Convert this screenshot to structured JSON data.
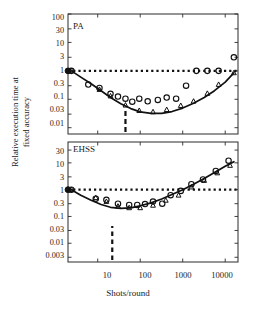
{
  "figure": {
    "xlabel": "Shots/round",
    "ylabel_line1": "Relative execution time at",
    "ylabel_line2": "fixed accuracy"
  },
  "chart_data": {
    "type": "line",
    "title": "",
    "xlabel": "Shots/round",
    "ylabel": "Relative execution time at fixed accuracy",
    "xscale": "log",
    "yscale": "log",
    "xlim": [
      2.0,
      20000
    ],
    "xticks": [
      10,
      100,
      1000,
      10000
    ],
    "xticklabels": [
      "10",
      "100",
      "1000",
      "10000"
    ],
    "panels": [
      {
        "name": "PA",
        "label": "PA",
        "ylim": [
          0.006,
          100
        ],
        "yticks": [
          100,
          30,
          10,
          3,
          1,
          0.3,
          0.1,
          0.03,
          0.01
        ],
        "yticklabels": [
          "100",
          "30",
          "10",
          "3",
          "1",
          "0.3",
          "0.1",
          "0.03",
          "0.01"
        ],
        "reference_line": {
          "style": "dotted",
          "y": 1.0
        },
        "optimum_marker": {
          "style": "dashed-vertical",
          "x": 45
        },
        "series": [
          {
            "name": "model curve",
            "style": "solid-line",
            "x": [
              2.4,
              4,
              7,
              12,
              20,
              35,
              60,
              100,
              180,
              320,
              560,
              1000,
              1800,
              3200,
              5600,
              10000,
              16000
            ],
            "values": [
              1.0,
              0.6,
              0.35,
              0.2,
              0.115,
              0.07,
              0.047,
              0.036,
              0.032,
              0.032,
              0.037,
              0.049,
              0.073,
              0.115,
              0.2,
              0.4,
              0.85
            ]
          },
          {
            "name": "open circles",
            "style": "open-circle",
            "x": [
              2.4,
              6,
              11,
              20,
              30,
              45,
              65,
              95,
              150,
              260,
              420,
              700,
              1200,
              2100,
              3800,
              7000,
              16000
            ],
            "values": [
              1.0,
              0.33,
              0.25,
              0.155,
              0.125,
              0.105,
              0.082,
              0.105,
              0.085,
              0.095,
              0.115,
              0.105,
              0.3,
              1.0,
              1.0,
              1.0,
              3.0
            ]
          },
          {
            "name": "triangles",
            "style": "triangle",
            "x": [
              2.4,
              11,
              20,
              45,
              95,
              200,
              420,
              900,
              1800,
              3800,
              7000,
              16000
            ],
            "values": [
              1.0,
              0.22,
              0.13,
              0.062,
              0.04,
              0.036,
              0.043,
              0.06,
              0.085,
              0.16,
              0.33,
              0.85
            ]
          }
        ]
      },
      {
        "name": "EHSS",
        "label": "EHSS",
        "ylim": [
          0.002,
          60
        ],
        "yticks": [
          30,
          10,
          3,
          1,
          0.3,
          0.1,
          0.03,
          0.01,
          0.003
        ],
        "yticklabels": [
          "30",
          "10",
          "3",
          "1",
          "0.3",
          "0.1",
          "0.03",
          "0.01",
          "0.003"
        ],
        "reference_line": {
          "style": "dotted",
          "y": 1.0
        },
        "optimum_marker": {
          "style": "dashed-vertical",
          "x": 22
        },
        "series": [
          {
            "name": "model curve",
            "style": "solid-line",
            "x": [
              2.4,
              4,
              7,
              12,
              20,
              35,
              60,
              100,
              180,
              320,
              560,
              1000,
              1800,
              3200,
              5600,
              10000,
              16000
            ],
            "values": [
              1.0,
              0.62,
              0.4,
              0.28,
              0.22,
              0.2,
              0.21,
              0.25,
              0.32,
              0.45,
              0.66,
              1.0,
              1.6,
              2.6,
              4.4,
              7.5,
              11.0
            ]
          },
          {
            "name": "open circles",
            "style": "open-circle",
            "x": [
              2.4,
              9,
              16,
              30,
              55,
              85,
              130,
              200,
              330,
              520,
              900,
              1600,
              3000,
              6000,
              12000
            ],
            "values": [
              1.0,
              0.46,
              0.42,
              0.3,
              0.27,
              0.27,
              0.29,
              0.36,
              0.3,
              0.62,
              0.9,
              1.6,
              2.4,
              5.0,
              12.0
            ]
          },
          {
            "name": "triangles",
            "style": "triangle",
            "x": [
              2.4,
              9,
              16,
              30,
              55,
              100,
              200,
              400,
              800,
              1600,
              3200,
              6500,
              13000
            ],
            "values": [
              1.0,
              0.5,
              0.36,
              0.24,
              0.21,
              0.21,
              0.26,
              0.4,
              0.62,
              1.25,
              2.2,
              4.2,
              8.0
            ]
          }
        ]
      }
    ]
  },
  "ticks": {
    "upper_y": [
      "100",
      "30",
      "10",
      "3",
      "1",
      "0.3",
      "0.1",
      "0.03",
      "0.01"
    ],
    "lower_y": [
      "30",
      "10",
      "3",
      "1",
      "0.3",
      "0.1",
      "0.03",
      "0.01",
      "0.003"
    ],
    "x": [
      "10",
      "100",
      "1000",
      "10000"
    ]
  },
  "panel_labels": {
    "upper": "PA",
    "lower": "EHSS"
  }
}
